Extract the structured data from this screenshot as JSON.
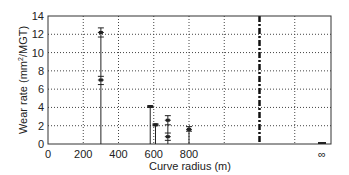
{
  "chart_data": {
    "type": "scatter",
    "title": "",
    "xlabel": "Curve radius (m)",
    "ylabel": "Wear rate (mm²/MGT)",
    "ylabel_parts": {
      "pre": "Wear rate (mm",
      "sup": "2",
      "post": "/MGT)"
    },
    "xlim": [
      0,
      1600
    ],
    "ylim": [
      0,
      14
    ],
    "x_ticks": [
      "0",
      "200",
      "400",
      "600",
      "800"
    ],
    "x_tick_values": [
      0,
      200,
      400,
      600,
      800
    ],
    "x_infinity_label": "∞",
    "y_ticks": [
      "0",
      "2",
      "4",
      "6",
      "8",
      "10",
      "12",
      "14"
    ],
    "y_tick_values": [
      0,
      2,
      4,
      6,
      8,
      10,
      12,
      14
    ],
    "grid": true,
    "grid_x": [
      200,
      400,
      600,
      800,
      1000,
      1200,
      1400
    ],
    "break_line_x": 1200,
    "series": [
      {
        "name": "measured wear",
        "points": [
          {
            "x": 300,
            "y": 12.2,
            "err_low": 11.7,
            "err_high": 12.7
          },
          {
            "x": 300,
            "y": 7.0,
            "err_low": 6.5,
            "err_high": 7.4
          },
          {
            "x": 580,
            "y": 4.1,
            "err_low": 4.0,
            "err_high": 4.2
          },
          {
            "x": 610,
            "y": 2.1,
            "err_low": 2.0,
            "err_high": 2.2
          },
          {
            "x": 680,
            "y": 2.6,
            "err_low": 2.1,
            "err_high": 3.1
          },
          {
            "x": 680,
            "y": 0.8,
            "err_low": 0.4,
            "err_high": 1.2
          },
          {
            "x": 800,
            "y": 1.6,
            "err_low": 1.4,
            "err_high": 1.9
          },
          {
            "x": "∞",
            "y": 0.05,
            "err_low": 0.0,
            "err_high": 0.1
          }
        ]
      }
    ]
  }
}
